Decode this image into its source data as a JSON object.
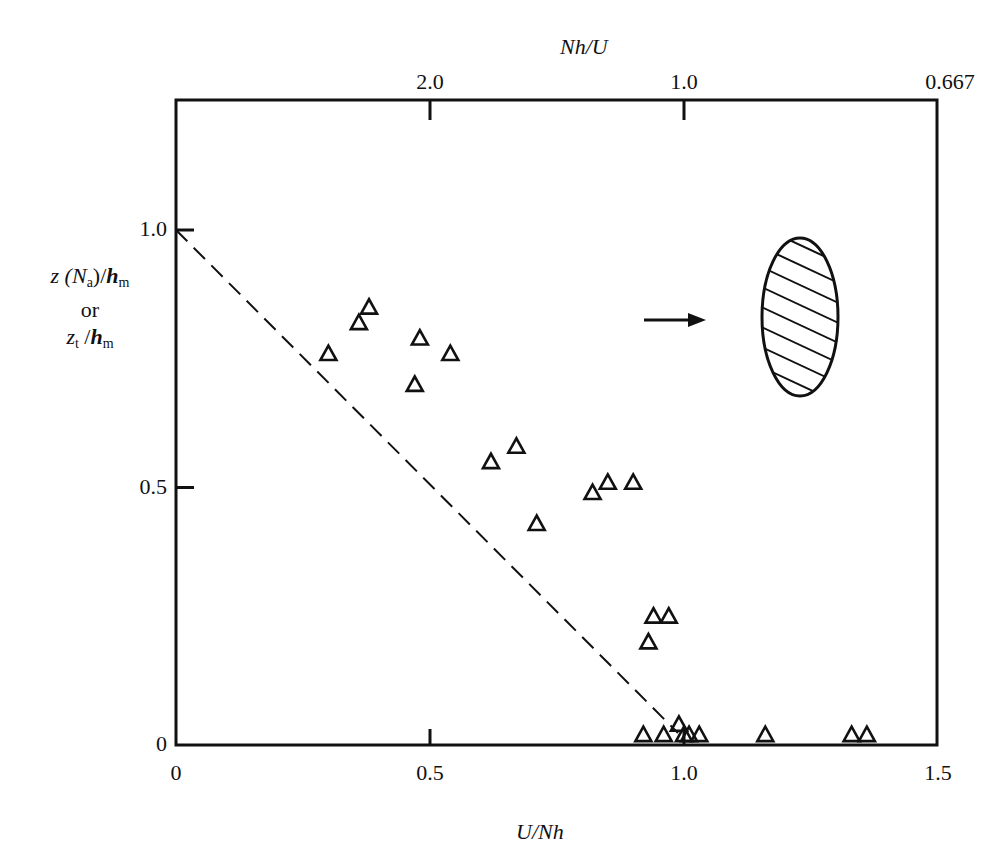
{
  "chart_data": {
    "type": "scatter",
    "title": "",
    "xlabel": "U/Nh",
    "ylabel_lines": [
      "z (N_a)/h_m",
      "or",
      "z_t /h_m"
    ],
    "top_axis_label": "Nh/U",
    "xlim": [
      0,
      1.5
    ],
    "ylim": [
      0,
      1.25
    ],
    "x_ticks": [
      {
        "value": 0,
        "label": "0"
      },
      {
        "value": 0.5,
        "label": "0.5"
      },
      {
        "value": 1.0,
        "label": "1.0"
      },
      {
        "value": 1.5,
        "label": "1.5"
      }
    ],
    "y_ticks": [
      {
        "value": 0,
        "label": "0"
      },
      {
        "value": 0.5,
        "label": "0.5"
      },
      {
        "value": 1.0,
        "label": "1.0"
      }
    ],
    "top_ticks": [
      {
        "x": 0.5,
        "label": "2.0"
      },
      {
        "x": 1.0,
        "label": "1.0"
      },
      {
        "x": 1.5,
        "label": "0.667"
      }
    ],
    "grid": false,
    "legend": null,
    "series": [
      {
        "name": "observations",
        "marker": "open-triangle",
        "points": [
          [
            0.3,
            0.76
          ],
          [
            0.36,
            0.82
          ],
          [
            0.38,
            0.85
          ],
          [
            0.47,
            0.7
          ],
          [
            0.48,
            0.79
          ],
          [
            0.54,
            0.76
          ],
          [
            0.62,
            0.55
          ],
          [
            0.67,
            0.58
          ],
          [
            0.71,
            0.43
          ],
          [
            0.82,
            0.49
          ],
          [
            0.85,
            0.51
          ],
          [
            0.9,
            0.51
          ],
          [
            0.93,
            0.2
          ],
          [
            0.94,
            0.25
          ],
          [
            0.97,
            0.25
          ],
          [
            0.92,
            0.02
          ],
          [
            0.96,
            0.02
          ],
          [
            0.99,
            0.04
          ],
          [
            1.0,
            0.02
          ],
          [
            1.01,
            0.02
          ],
          [
            1.03,
            0.02
          ],
          [
            1.16,
            0.02
          ],
          [
            1.33,
            0.02
          ],
          [
            1.36,
            0.02
          ]
        ]
      },
      {
        "name": "theory line",
        "style": "dashed",
        "points": [
          [
            0,
            1.0
          ],
          [
            1.0,
            0.0
          ]
        ]
      }
    ],
    "annotations": [
      {
        "type": "arrow",
        "description": "flow direction arrow pointing right",
        "from": [
          0.91,
          0.84
        ],
        "to": [
          1.02,
          0.84
        ]
      },
      {
        "type": "hatched-ellipse",
        "description": "obstacle cross-section",
        "center": [
          1.22,
          0.85
        ],
        "rx": 0.085,
        "ry": 0.26
      }
    ]
  },
  "labels": {
    "xlabel": "U/Nh",
    "top_axis_label": "Nh/U",
    "ylabel_line1_a": "z (N",
    "ylabel_line1_sub": "a",
    "ylabel_line1_b": ")/",
    "ylabel_line1_h": "h",
    "ylabel_line1_hsub": "m",
    "ylabel_line2": "or",
    "ylabel_line3_z": "z",
    "ylabel_line3_zsub": "t",
    "ylabel_line3_slash": " /",
    "ylabel_line3_h": "h",
    "ylabel_line3_hsub": "m"
  },
  "colors": {
    "ink": "#111111",
    "background": "#ffffff"
  }
}
